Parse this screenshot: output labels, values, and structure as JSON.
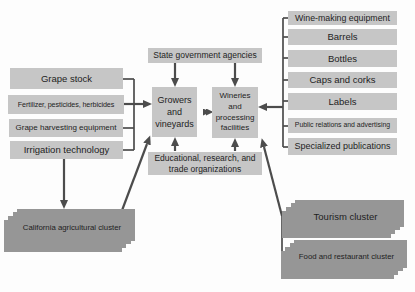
{
  "colors": {
    "box_light": "#c6c6c6",
    "box_cluster": "#969696",
    "line": "#4c4c4c",
    "text": "#1e1e1e",
    "background": "#fdfdfd"
  },
  "left_column": [
    "Grape stock",
    "Fertilizer, pesticides, herbicides",
    "Grape harvesting equipment",
    "Irrigation technology"
  ],
  "center": {
    "state_agencies": "State government agencies",
    "growers": "Growers and vineyards",
    "wineries": "Wineries and processing facilities",
    "educational": "Educational, research, and trade organizations"
  },
  "right_column": [
    "Wine-making equipment",
    "Barrels",
    "Bottles",
    "Caps and corks",
    "Labels",
    "Public relations and advertising",
    "Specialized publications"
  ],
  "clusters": {
    "california": "California agricultural cluster",
    "tourism": "Tourism cluster",
    "food": "Food and restaurant cluster"
  }
}
